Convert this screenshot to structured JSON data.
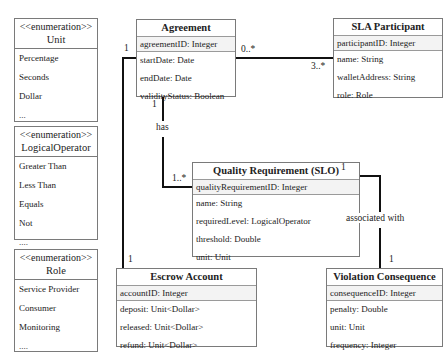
{
  "enumerations": [
    {
      "stereotype": "<<enumeration>>",
      "name": "Unit",
      "literals": [
        "Percentage",
        "Seconds",
        "Dollar",
        "..."
      ]
    },
    {
      "stereotype": "<<enumeration>>",
      "name": "LogicalOperator",
      "literals": [
        "Greater Than",
        "Less Than",
        "Equals",
        "Not",
        "...."
      ]
    },
    {
      "stereotype": "<<enumeration>>",
      "name": "Role",
      "literals": [
        "Service Provider",
        "Consumer",
        "Monitoring",
        "...."
      ]
    }
  ],
  "classes": {
    "agreement": {
      "name": "Agreement",
      "id": "agreementID: Integer",
      "attributes": [
        "startDate: Date",
        "endDate: Date",
        "validityStatus: Boolean"
      ]
    },
    "sla_participant": {
      "name": "SLA Participant",
      "id": "participantID: Integer",
      "attributes": [
        "name: String",
        "walletAddress: String",
        "role: Role"
      ]
    },
    "quality_requirement": {
      "name": "Quality Requirement (SLO)",
      "id": "qualityRequirementID: Integer",
      "attributes": [
        "name: String",
        "requiredLevel: LogicalOperator",
        "threshold: Double",
        "unit: Unit"
      ]
    },
    "escrow_account": {
      "name": "Escrow Account",
      "id": "accountID: Integer",
      "attributes": [
        "deposit: Unit<Dollar>",
        "released: Unit<Dollar>",
        "refund: Unit<Dollar>"
      ]
    },
    "violation_consequence": {
      "name": "Violation Consequence",
      "id": "consequenceID: Integer",
      "attributes": [
        "penalty: Double",
        "unit: Unit",
        "frequency: Integer"
      ]
    }
  },
  "associations": {
    "agreement_participant": {
      "from_mult": "0..*",
      "to_mult": "3..*"
    },
    "agreement_escrow": {
      "from_mult": "1",
      "to_mult": "1"
    },
    "agreement_quality": {
      "label": "has",
      "from_mult": "1",
      "to_mult": "1..*"
    },
    "quality_violation": {
      "label": "associated with",
      "from_mult": "1",
      "to_mult": "1"
    }
  },
  "colors": {
    "line": "#111111",
    "border": "#7a7a7a",
    "id_row_bg": "#f3f3f3"
  }
}
